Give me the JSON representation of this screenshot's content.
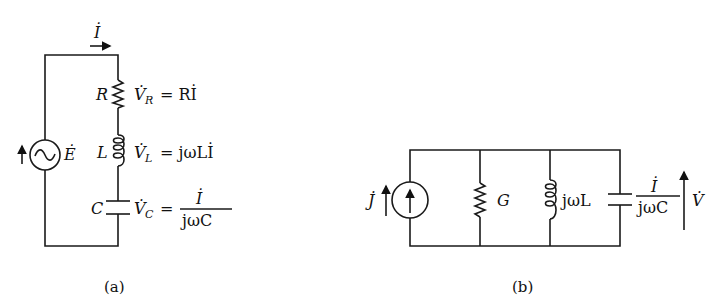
{
  "figure_a": {
    "caption": "(a)",
    "current_label": "İ",
    "source_label": "Ė",
    "resistor": {
      "symbol": "R",
      "voltage": "V̇",
      "sub": "R",
      "equation": "= RİL"
    },
    "inductor": {
      "symbol": "L",
      "voltage": "V̇",
      "sub": "L",
      "equation": "= jωLİ"
    },
    "capacitor": {
      "symbol": "C",
      "voltage": "V̇",
      "sub": "C",
      "equals": "=",
      "numerator": "İ",
      "denominator": "jωC"
    }
  },
  "figure_b": {
    "caption": "(b)",
    "source_label": "J̇",
    "conductance": "G",
    "inductor": "jωL",
    "capacitor_numerator": "İ",
    "capacitor_denominator": "jωC",
    "voltage_label": "V̇"
  },
  "texts": {
    "r_eq": "= Rİ",
    "l_eq": "= jωLİ"
  }
}
